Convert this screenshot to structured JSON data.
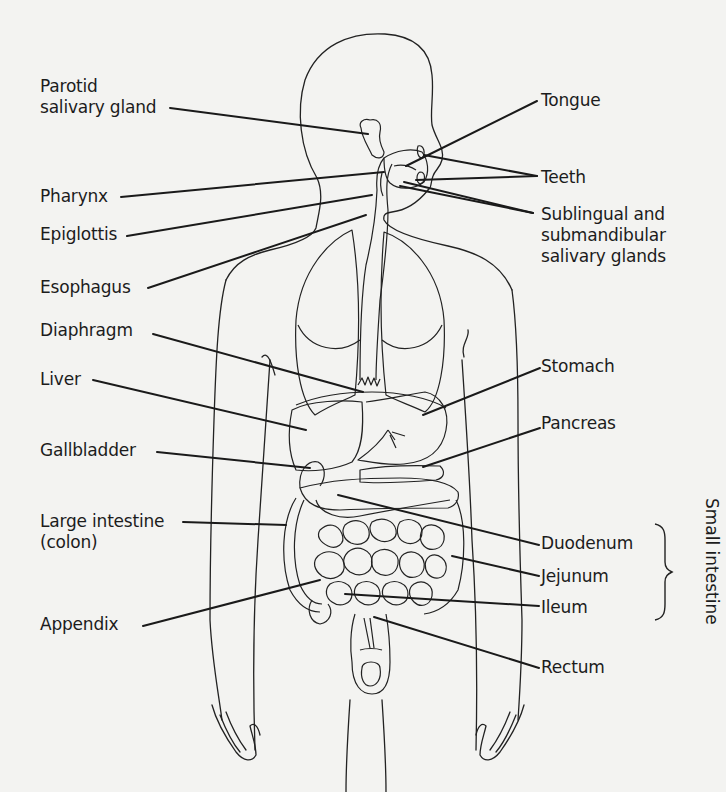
{
  "diagram": {
    "labels_left": [
      {
        "id": "parotid",
        "lines": [
          "Parotid",
          "salivary gland"
        ]
      },
      {
        "id": "pharynx",
        "lines": [
          "Pharynx"
        ]
      },
      {
        "id": "epiglottis",
        "lines": [
          "Epiglottis"
        ]
      },
      {
        "id": "esophagus",
        "lines": [
          "Esophagus"
        ]
      },
      {
        "id": "diaphragm",
        "lines": [
          "Diaphragm"
        ]
      },
      {
        "id": "liver",
        "lines": [
          "Liver"
        ]
      },
      {
        "id": "gallbladder",
        "lines": [
          "Gallbladder"
        ]
      },
      {
        "id": "large-intestine",
        "lines": [
          "Large intestine",
          "(colon)"
        ]
      },
      {
        "id": "appendix",
        "lines": [
          "Appendix"
        ]
      }
    ],
    "labels_right": [
      {
        "id": "tongue",
        "lines": [
          "Tongue"
        ]
      },
      {
        "id": "teeth",
        "lines": [
          "Teeth"
        ]
      },
      {
        "id": "sublingual",
        "lines": [
          "Sublingual and",
          "submandibular",
          "salivary glands"
        ]
      },
      {
        "id": "stomach",
        "lines": [
          "Stomach"
        ]
      },
      {
        "id": "pancreas",
        "lines": [
          "Pancreas"
        ]
      },
      {
        "id": "duodenum",
        "lines": [
          "Duodenum"
        ]
      },
      {
        "id": "jejunum",
        "lines": [
          "Jejunum"
        ]
      },
      {
        "id": "ileum",
        "lines": [
          "Ileum"
        ]
      },
      {
        "id": "rectum",
        "lines": [
          "Rectum"
        ]
      }
    ],
    "group_bracket": {
      "label": "Small intestine",
      "members": [
        "Duodenum",
        "Jejunum",
        "Ileum"
      ]
    },
    "colors": {
      "background": "#f3f3f1",
      "ink": "#1c1c1c"
    }
  }
}
